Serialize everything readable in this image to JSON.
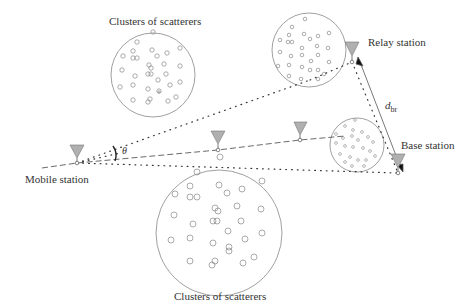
{
  "labels": {
    "cluster_top": "Clusters of scatterers",
    "cluster_bottom": "Clusters of scatterers",
    "relay": "Relay station",
    "base": "Base station",
    "mobile": "Mobile station",
    "theta": "θ",
    "distance_main": "d",
    "distance_sub": "br"
  },
  "colors": {
    "line": "#444444",
    "antenna_fill": "#b0b0b0",
    "circle": "#888888"
  }
}
